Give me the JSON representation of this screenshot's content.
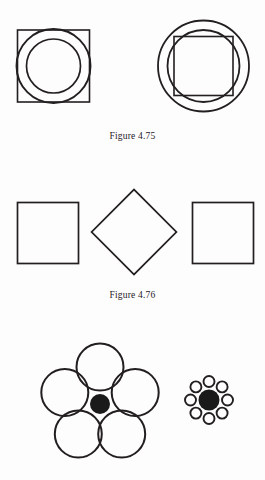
{
  "page": {
    "width": 265,
    "height": 480,
    "background_color": "#fdfdfd",
    "stroke_color": "#231f20",
    "fill_black": "#1a1a1a"
  },
  "captions": {
    "figure_475": "Figure 4.75",
    "figure_476": "Figure 4.76"
  },
  "figures": [
    {
      "id": "figure-4-75",
      "caption": "Figure 4.75",
      "items": [
        {
          "name": "square-with-two-concentric-circles",
          "shapes": [
            {
              "type": "square",
              "cx": 53.5,
              "cy": 66,
              "size": 72
            },
            {
              "type": "circle",
              "cx": 53.5,
              "cy": 66,
              "r": 37
            },
            {
              "type": "circle",
              "cx": 53.5,
              "cy": 66,
              "r": 27
            }
          ]
        },
        {
          "name": "two-concentric-circles-with-square",
          "shapes": [
            {
              "type": "circle",
              "cx": 203.5,
              "cy": 66,
              "r": 45.5
            },
            {
              "type": "circle",
              "cx": 203.5,
              "cy": 66,
              "r": 36
            },
            {
              "type": "square",
              "cx": 203.5,
              "cy": 66,
              "size": 59
            }
          ]
        }
      ]
    },
    {
      "id": "figure-4-76",
      "caption": "Figure 4.76",
      "items": [
        {
          "name": "square-left",
          "type": "square",
          "cx": 48,
          "cy": 233,
          "size": 61,
          "rotation": 0
        },
        {
          "name": "diamond-center",
          "type": "square",
          "cx": 134,
          "cy": 232,
          "size": 60,
          "rotation": 45
        },
        {
          "name": "square-right",
          "type": "square",
          "cx": 223,
          "cy": 233,
          "size": 61,
          "rotation": 0
        }
      ]
    },
    {
      "id": "ebbinghaus-illusion",
      "caption": "",
      "items": [
        {
          "name": "large-surround-cluster",
          "center": {
            "cx": 100,
            "cy": 404,
            "r": 10,
            "fill": "#1a1a1a"
          },
          "surround_count": 5,
          "surround_radius": 23.5,
          "orbit_radius": 37,
          "start_angle": -90
        },
        {
          "name": "small-surround-cluster",
          "center": {
            "cx": 209,
            "cy": 400,
            "r": 10.5,
            "fill": "#1a1a1a"
          },
          "surround_count": 8,
          "surround_radius": 5.5,
          "orbit_radius": 18.5,
          "start_angle": -90
        }
      ]
    }
  ]
}
